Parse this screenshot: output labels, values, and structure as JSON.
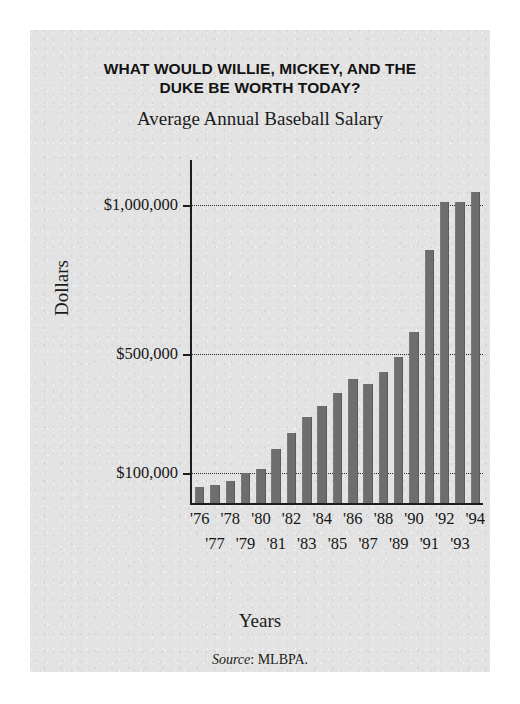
{
  "figure": {
    "headline_line1": "WHAT WOULD WILLIE, MICKEY, AND THE",
    "headline_line2": "DUKE BE WORTH TODAY?",
    "subtitle": "Average Annual Baseball Salary",
    "source_label": "Source",
    "source_value": ": MLBPA.",
    "panel_color": "#e3e3e3",
    "bar_color": "#6e6e6e",
    "axis_color": "#1d1d1d"
  },
  "chart_data": {
    "type": "bar",
    "title": "WHAT WOULD WILLIE, MICKEY, AND THE DUKE BE WORTH TODAY?",
    "subtitle": "Average Annual Baseball Salary",
    "xlabel": "Years",
    "ylabel": "Dollars",
    "grid": true,
    "legend": null,
    "ylim": [
      0,
      1100000
    ],
    "ytick_values": [
      100000,
      500000,
      1000000
    ],
    "ytick_labels": [
      "$100,000",
      "$500,000",
      "$1,000,000"
    ],
    "categories": [
      "'76",
      "'77",
      "'78",
      "'79",
      "'80",
      "'81",
      "'82",
      "'83",
      "'84",
      "'85",
      "'86",
      "'87",
      "'88",
      "'89",
      "'90",
      "'91",
      "'92",
      "'93",
      "'94"
    ],
    "xtick_labels_even_row": [
      "'76",
      "'78",
      "'80",
      "'82",
      "'84",
      "'86",
      "'88",
      "'90",
      "'92",
      "'94"
    ],
    "xtick_labels_odd_row": [
      "'77",
      "'79",
      "'81",
      "'83",
      "'85",
      "'87",
      "'89",
      "'91",
      "'93"
    ],
    "values": [
      55000,
      60000,
      75000,
      100000,
      115000,
      180000,
      235000,
      290000,
      325000,
      370000,
      415000,
      400000,
      440000,
      490000,
      575000,
      850000,
      1010000,
      1010000,
      1045000
    ],
    "value_unit": "US dollars per year",
    "source": "Source: MLBPA."
  }
}
